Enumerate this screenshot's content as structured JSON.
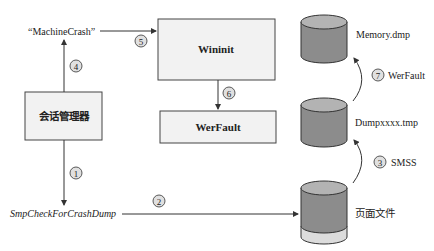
{
  "diagram": {
    "nodes": {
      "machine_crash": "“MachineCrash”",
      "session_manager": "会话管理器",
      "wininit": "Wininit",
      "werfault_box": "WerFault",
      "smp_check": "SmpCheckForCrashDump",
      "memory_dmp": "Memory.dmp",
      "dump_tmp": "Dumpxxxx.tmp",
      "page_file": "页面文件"
    },
    "steps": [
      {
        "num": "1",
        "label": ""
      },
      {
        "num": "2",
        "label": ""
      },
      {
        "num": "3",
        "label": "SMSS"
      },
      {
        "num": "4",
        "label": ""
      },
      {
        "num": "5",
        "label": ""
      },
      {
        "num": "6",
        "label": ""
      },
      {
        "num": "7",
        "label": "WerFault"
      }
    ],
    "colors": {
      "box_fill": "#f2f2f2",
      "cylinder_body": "#8c8c8c",
      "cylinder_top": "#b3b3b3",
      "cylinder_base": "#dcdcdc",
      "stroke": "#333333"
    }
  }
}
